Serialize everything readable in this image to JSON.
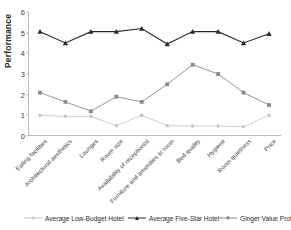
{
  "chart_data": {
    "type": "line",
    "title": "",
    "xlabel": "",
    "ylabel": "Performance",
    "ylim": [
      0,
      6
    ],
    "yticks": [
      0,
      1,
      2,
      3,
      4,
      5,
      6
    ],
    "grid": false,
    "legend_position": "bottom",
    "categories": [
      "Eating facilities",
      "Architectural aesthetics",
      "Lounges",
      "Room size",
      "Availability of receptionist",
      "Furniture and amenities in room",
      "Bed quality",
      "Hygiene",
      "Room quietness",
      "Price"
    ],
    "series": [
      {
        "name": "Average Low-Budget Hotel",
        "marker": "circle",
        "color": "#c8c8c8",
        "values": [
          1.0,
          0.95,
          0.95,
          0.5,
          1.0,
          0.5,
          0.48,
          0.48,
          0.45,
          1.0
        ]
      },
      {
        "name": "Average Five-Star Hotel",
        "marker": "triangle",
        "color": "#2b2b2b",
        "values": [
          5.05,
          4.5,
          5.05,
          5.05,
          5.2,
          4.45,
          5.05,
          5.05,
          4.5,
          4.95
        ]
      },
      {
        "name": "Ginger Value Profile",
        "marker": "square",
        "color": "#8a8a8a",
        "values": [
          2.1,
          1.65,
          1.2,
          1.9,
          1.65,
          2.5,
          3.45,
          3.0,
          2.1,
          1.5
        ]
      }
    ]
  },
  "axis": {
    "y_title": "Performance"
  },
  "legend": {
    "items": [
      {
        "label": "Average Low-Budget Hotel"
      },
      {
        "label": "Average Five-Star Hotel"
      },
      {
        "label": "Ginger Value Profile"
      }
    ]
  },
  "colors": {
    "low_budget": "#c8c8c8",
    "five_star": "#2b2b2b",
    "ginger": "#8a8a8a",
    "axis": "#b9b9b9",
    "text": "#2b2b2b",
    "background": "#ffffff"
  }
}
